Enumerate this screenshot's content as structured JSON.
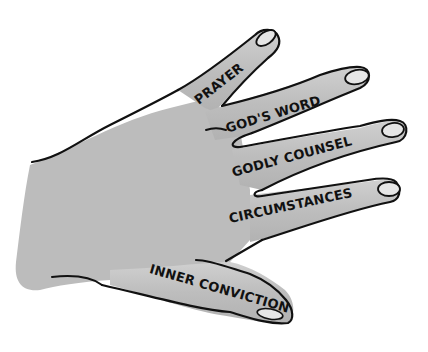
{
  "illustration": {
    "subject": "hand",
    "colors": {
      "skin": "#bcbcbc",
      "outline": "#111111",
      "nail": "#e2e2e2",
      "background": "#ffffff"
    },
    "fingers": [
      {
        "id": "index",
        "label": "PRAYER"
      },
      {
        "id": "middle",
        "label": "GOD'S WORD"
      },
      {
        "id": "ring",
        "label": "GODLY COUNSEL"
      },
      {
        "id": "pinky",
        "label": "CIRCUMSTANCES"
      },
      {
        "id": "thumb",
        "label": "INNER CONVICTION"
      }
    ]
  }
}
